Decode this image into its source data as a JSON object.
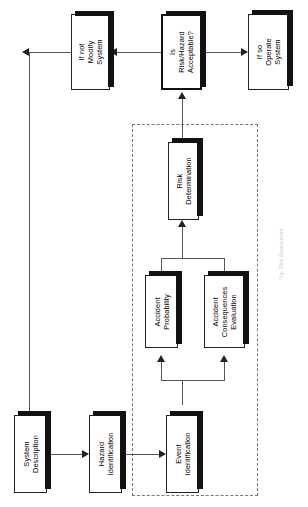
{
  "diagram": {
    "orientation": "rotated-90-ccw",
    "group_label": "Risk Analysis",
    "caption": "Fig. Risk Assessment"
  },
  "colors": {
    "box_fill": "#ffffff",
    "box_border": "#222222",
    "shadow": "#111111",
    "connector": "#555555",
    "dashed_region": "#777777"
  },
  "nodes": [
    {
      "id": "system-description",
      "lines": [
        "System",
        "Description"
      ]
    },
    {
      "id": "hazard-identification",
      "lines": [
        "Hazard",
        "Identification"
      ]
    },
    {
      "id": "event-identification",
      "lines": [
        "Event",
        "Identification"
      ]
    },
    {
      "id": "accident-probability",
      "lines": [
        "Accident",
        "Probability"
      ]
    },
    {
      "id": "accident-consequences-evaluation",
      "lines": [
        "Accident",
        "Consequences",
        "Evaluation"
      ]
    },
    {
      "id": "risk-determination",
      "lines": [
        "Risk",
        "Determination"
      ]
    },
    {
      "id": "risk-hazard-acceptable",
      "lines": [
        "Is",
        "Risk/Hazard",
        "Acceptable?"
      ]
    },
    {
      "id": "if-not-modify-system",
      "lines": [
        "If not",
        "Modify",
        "System"
      ]
    },
    {
      "id": "if-so-operate-system",
      "lines": [
        "If so",
        "Operate",
        "System"
      ]
    }
  ]
}
